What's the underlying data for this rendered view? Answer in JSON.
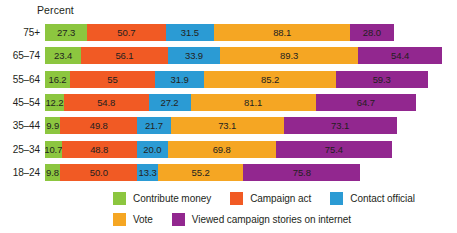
{
  "chart": {
    "axis_caption": "Percent",
    "type": "bar"
  },
  "chart_data": {
    "type": "bar",
    "orientation": "horizontal",
    "stacked": true,
    "title": "",
    "subtitle": "",
    "xlabel": "Percent",
    "ylabel": "",
    "grid": false,
    "legend_position": "bottom",
    "categories": [
      "75+",
      "65–74",
      "55–64",
      "45–54",
      "35–44",
      "25–34",
      "18–24"
    ],
    "series": [
      {
        "name": "Contribute money",
        "color": "#8CC63F",
        "values": [
          27.3,
          23.4,
          16.2,
          12.2,
          9.9,
          10.7,
          9.8
        ],
        "labels": [
          "27.3",
          "23.4",
          "16.2",
          "12.2",
          "9.9",
          "10.7",
          "9.8"
        ]
      },
      {
        "name": "Campaign act",
        "color": "#F15A24",
        "values": [
          50.7,
          56.1,
          55.0,
          54.8,
          49.8,
          48.8,
          50.0
        ],
        "labels": [
          "50.7",
          "56.1",
          "55",
          "54.8",
          "49.8",
          "48.8",
          "50.0"
        ]
      },
      {
        "name": "Contact official",
        "color": "#2B9BD4",
        "values": [
          31.5,
          33.9,
          31.9,
          27.2,
          21.7,
          20.0,
          13.3
        ],
        "labels": [
          "31.5",
          "33.9",
          "31.9",
          "27.2",
          "21.7",
          "20.0",
          "13.3"
        ]
      },
      {
        "name": "Vote",
        "color": "#F5A623",
        "values": [
          88.1,
          89.3,
          85.2,
          81.1,
          73.1,
          69.8,
          55.2
        ],
        "labels": [
          "88.1",
          "89.3",
          "85.2",
          "81.1",
          "73.1",
          "69.8",
          "55.2"
        ]
      },
      {
        "name": "Viewed campaign stories on internet",
        "color": "#92278F",
        "values": [
          28.0,
          54.4,
          59.3,
          64.7,
          73.1,
          75.4,
          75.8
        ],
        "labels": [
          "28.0",
          "54.4",
          "59.3",
          "64.7",
          "73.1",
          "75.4",
          "75.8"
        ]
      }
    ]
  },
  "legend": {
    "rows": [
      [
        {
          "label": "Contribute money",
          "color": "#8CC63F"
        },
        {
          "label": "Campaign act",
          "color": "#F15A24"
        },
        {
          "label": "Contact official",
          "color": "#2B9BD4"
        }
      ],
      [
        {
          "label": "Vote",
          "color": "#F5A623"
        },
        {
          "label": "Viewed campaign stories on internet",
          "color": "#92278F"
        }
      ]
    ]
  }
}
